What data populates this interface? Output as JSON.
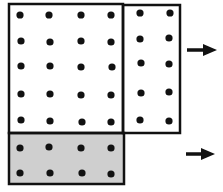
{
  "diagram": {
    "colors": {
      "line": "#111111",
      "dot": "#111111",
      "shaded_fill": "#cfcfcf",
      "background": "#ffffff"
    },
    "regions": [
      {
        "name": "top-left-block",
        "rows": 5,
        "cols": 4,
        "shaded": false
      },
      {
        "name": "top-right-block",
        "rows": 5,
        "cols": 2,
        "shaded": false
      },
      {
        "name": "bottom-shaded-block",
        "rows": 2,
        "cols": 4,
        "shaded": true
      }
    ],
    "arrows": [
      {
        "name": "arrow-top",
        "direction": "right"
      },
      {
        "name": "arrow-bottom",
        "direction": "right"
      }
    ]
  }
}
